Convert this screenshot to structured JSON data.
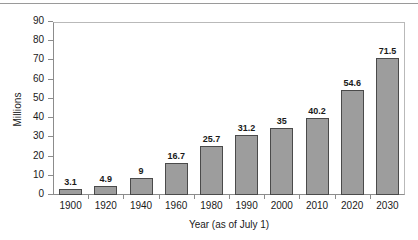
{
  "chart_data": {
    "type": "bar",
    "title": "",
    "xlabel": "Year (as of July 1)",
    "ylabel": "Millions",
    "categories": [
      "1900",
      "1920",
      "1940",
      "1960",
      "1980",
      "1990",
      "2000",
      "2010",
      "2020",
      "2030"
    ],
    "values": [
      3.1,
      4.9,
      9,
      16.7,
      25.7,
      31.2,
      35,
      40.2,
      54.6,
      71.5
    ],
    "value_labels": [
      "3.1",
      "4.9",
      "9",
      "16.7",
      "25.7",
      "31.2",
      "35",
      "40.2",
      "54.6",
      "71.5"
    ],
    "ylim": [
      0,
      90
    ],
    "ytick_values": [
      0,
      10,
      20,
      30,
      40,
      50,
      60,
      70,
      80,
      90
    ],
    "ytick_labels": [
      "0",
      "10",
      "20",
      "30",
      "40",
      "50",
      "60",
      "70",
      "80",
      "90"
    ],
    "grid": false,
    "legend": null,
    "series": [
      {
        "name": "Population",
        "values": [
          3.1,
          4.9,
          9,
          16.7,
          25.7,
          31.2,
          35,
          40.2,
          54.6,
          71.5
        ]
      }
    ],
    "colors": {
      "bar_fill": "#9d9d9d",
      "bar_border": "#4a4a4a",
      "axis": "#8c8c8c",
      "text": "#1a1a1a",
      "background": "#ffffff"
    }
  }
}
